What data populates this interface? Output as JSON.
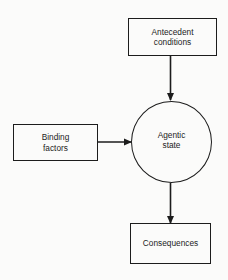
{
  "diagram": {
    "nodes": {
      "antecedent": {
        "shape": "rectangle",
        "lines": [
          "Antecedent",
          "conditions"
        ]
      },
      "binding": {
        "shape": "rectangle",
        "lines": [
          "Binding",
          "factors"
        ]
      },
      "agentic": {
        "shape": "circle",
        "lines": [
          "Agentic",
          "state"
        ]
      },
      "consequences": {
        "shape": "rectangle",
        "lines": [
          "Consequences"
        ]
      }
    },
    "edges": [
      {
        "from": "Antecedent conditions",
        "to": "Agentic state"
      },
      {
        "from": "Binding factors",
        "to": "Agentic state"
      },
      {
        "from": "Agentic state",
        "to": "Consequences"
      }
    ],
    "colors": {
      "stroke": "#1c1c1c",
      "background": "#fbfbfa"
    }
  }
}
